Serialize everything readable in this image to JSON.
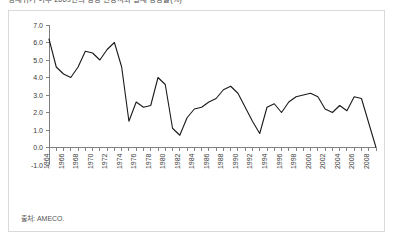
{
  "title": "경제위기 이후 2009년의 성장 전망치와 실제 성장률(%)",
  "source_note": "출처: AMECO.",
  "colors": {
    "line": "#1a1a1a",
    "axis": "#808080",
    "frame": "#d9d9d9",
    "text": "#3a3a3a",
    "background": "#ffffff"
  },
  "chart_data": {
    "type": "line",
    "title": "",
    "xlabel": "",
    "ylabel": "",
    "ylim": [
      -1.0,
      7.0
    ],
    "ytick_step": 1.0,
    "yticks": [
      "7.0",
      "6.0",
      "5.0",
      "4.0",
      "3.0",
      "2.0",
      "1.0",
      "0.0",
      "-1.0"
    ],
    "grid": false,
    "legend": "none",
    "zero_line": true,
    "xtick_labels": [
      "1964",
      "1966",
      "1968",
      "1970",
      "1972",
      "1974",
      "1976",
      "1978",
      "1980",
      "1982",
      "1984",
      "1986",
      "1988",
      "1990",
      "1992",
      "1994",
      "1996",
      "1998",
      "2000",
      "2002",
      "2004",
      "2006",
      "2008"
    ],
    "xtick_every": 2,
    "x": [
      1964,
      1965,
      1966,
      1967,
      1968,
      1969,
      1970,
      1971,
      1972,
      1973,
      1974,
      1975,
      1976,
      1977,
      1978,
      1979,
      1980,
      1981,
      1982,
      1983,
      1984,
      1985,
      1986,
      1987,
      1988,
      1989,
      1990,
      1991,
      1992,
      1993,
      1994,
      1995,
      1996,
      1997,
      1998,
      1999,
      2000,
      2001,
      2002,
      2003,
      2004,
      2005,
      2006,
      2007,
      2008,
      2009
    ],
    "values": [
      6.2,
      4.6,
      4.2,
      4.0,
      4.6,
      5.5,
      5.4,
      5.0,
      5.6,
      6.0,
      4.6,
      1.5,
      2.6,
      2.3,
      2.4,
      4.0,
      3.6,
      1.1,
      0.7,
      1.7,
      2.2,
      2.3,
      2.6,
      2.8,
      3.3,
      3.5,
      3.1,
      2.3,
      1.5,
      0.8,
      2.3,
      2.5,
      2.0,
      2.6,
      2.9,
      3.0,
      3.1,
      2.9,
      2.2,
      2.0,
      2.4,
      2.1,
      2.9,
      2.8,
      1.4,
      0.0
    ],
    "series_name": "성장률"
  }
}
